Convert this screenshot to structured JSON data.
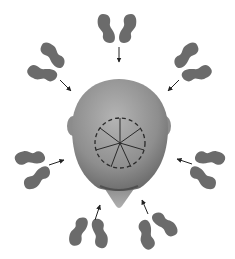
{
  "diagram": {
    "colors": {
      "background": "#ffffff",
      "footprint": "#6b6b6b",
      "head_light": "#a8a8a8",
      "head_dark": "#6e6e6e",
      "arrow": "#222222",
      "crown_lines": "#2a2a2a"
    },
    "crown_spokes": 7,
    "positions": [
      {
        "name": "top",
        "cx": 118,
        "cy": 28,
        "angle": 0
      },
      {
        "name": "upper-left",
        "cx": 52,
        "cy": 66,
        "angle": -55
      },
      {
        "name": "upper-right",
        "cx": 192,
        "cy": 66,
        "angle": 55
      },
      {
        "name": "left",
        "cx": 32,
        "cy": 168,
        "angle": -110
      },
      {
        "name": "right",
        "cx": 210,
        "cy": 168,
        "angle": 110
      },
      {
        "name": "lower-left",
        "cx": 88,
        "cy": 233,
        "angle": -160
      },
      {
        "name": "lower-right",
        "cx": 155,
        "cy": 230,
        "angle": 155
      }
    ]
  }
}
